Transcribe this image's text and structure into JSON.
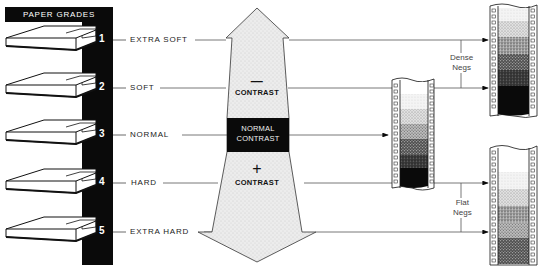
{
  "header": {
    "title": "PAPER GRADES"
  },
  "grades": [
    {
      "number": "1",
      "label": "EXTRA SOFT",
      "y": 40
    },
    {
      "number": "2",
      "label": "SOFT",
      "y": 88
    },
    {
      "number": "3",
      "label": "NORMAL",
      "y": 135
    },
    {
      "number": "4",
      "label": "HARD",
      "y": 183
    },
    {
      "number": "5",
      "label": "EXTRA HARD",
      "y": 232
    }
  ],
  "arrow": {
    "top_sign": "—",
    "top_label": "CONTRAST",
    "middle_label_line1": "NORMAL",
    "middle_label_line2": "CONTRAST",
    "bottom_sign": "+",
    "bottom_label": "CONTRAST"
  },
  "negatives": {
    "dense_line1": "Dense",
    "dense_line2": "Negs",
    "flat_line1": "Flat",
    "flat_line2": "Negs"
  },
  "colors": {
    "ink": "#0a0a0a",
    "arrow_fill": "#e6e6e6",
    "line": "#555555"
  }
}
